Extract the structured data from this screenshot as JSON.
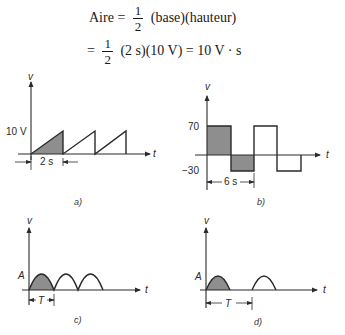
{
  "equations": {
    "line1": {
      "lhs": "Aire =",
      "frac_num": "1",
      "frac_den": "2",
      "rhs": "(base)(hauteur)"
    },
    "line2": {
      "lhs": "=",
      "frac_num": "1",
      "frac_den": "2",
      "rhs": "(2 s)(10 V) = 10 V · s"
    }
  },
  "figures": {
    "a": {
      "caption": "a)",
      "y_label": "v",
      "x_label": "t",
      "level_label": "10 V",
      "dimension_label": "2 s",
      "shape": "sawtooth",
      "cycles": 3,
      "shaded": "first tooth"
    },
    "b": {
      "caption": "b)",
      "y_label": "v",
      "x_label": "t",
      "high_label": "70",
      "low_label": "−30",
      "dimension_label": "6 s",
      "shape": "square wave",
      "cycles": 2,
      "shaded": "first period"
    },
    "c": {
      "caption": "c)",
      "y_label": "v",
      "x_label": "t",
      "level_label": "A",
      "dimension_label": "T",
      "shape": "full-wave rectified sine",
      "humps": 3,
      "shaded": "first hump"
    },
    "d": {
      "caption": "d)",
      "y_label": "v",
      "x_label": "t",
      "level_label": "A",
      "dimension_label": "T",
      "shape": "half-wave rectified sine",
      "humps": 2,
      "shaded": "first hump"
    }
  },
  "colors": {
    "ink": "#2a2a2a",
    "shade": "#8e8e8e"
  }
}
